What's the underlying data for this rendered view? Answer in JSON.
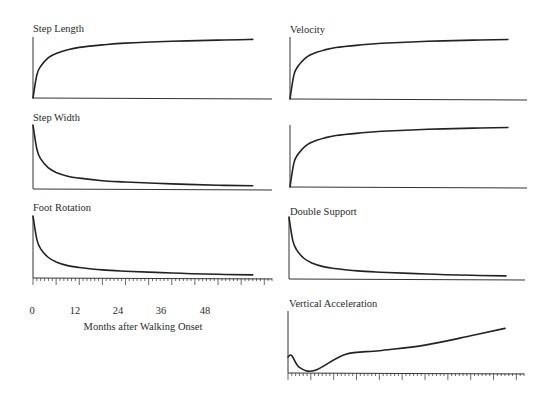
{
  "figure": {
    "x_axis_label": "Months after Walking Onset",
    "x_tick_labels": [
      "0",
      "12",
      "24",
      "36",
      "48"
    ]
  },
  "chart_data": [
    {
      "type": "line",
      "title": "Step Length",
      "xlabel": "Months after Walking Onset",
      "ylabel": "",
      "trend": "rapid rise then plateau",
      "x": [
        0,
        1,
        2,
        4,
        6,
        9,
        12,
        18,
        24,
        36,
        48,
        57
      ],
      "values": [
        0.0,
        0.38,
        0.52,
        0.66,
        0.73,
        0.79,
        0.83,
        0.87,
        0.9,
        0.93,
        0.95,
        0.96
      ],
      "xlim": [
        0,
        62
      ],
      "ylim": [
        0,
        1
      ]
    },
    {
      "type": "line",
      "title": "Step Width",
      "xlabel": "Months after Walking Onset",
      "ylabel": "",
      "trend": "rapid decline then plateau",
      "x": [
        0,
        1,
        2,
        4,
        6,
        9,
        12,
        18,
        24,
        36,
        48,
        57
      ],
      "values": [
        1.0,
        0.62,
        0.47,
        0.33,
        0.26,
        0.2,
        0.17,
        0.13,
        0.11,
        0.08,
        0.06,
        0.05
      ],
      "xlim": [
        0,
        62
      ],
      "ylim": [
        0,
        1
      ]
    },
    {
      "type": "line",
      "title": "Foot Rotation",
      "xlabel": "Months after Walking Onset",
      "ylabel": "",
      "trend": "rapid decline then plateau",
      "x": [
        0,
        1,
        2,
        4,
        6,
        9,
        12,
        18,
        24,
        36,
        48,
        57
      ],
      "values": [
        1.0,
        0.62,
        0.47,
        0.33,
        0.26,
        0.2,
        0.17,
        0.13,
        0.11,
        0.08,
        0.06,
        0.05
      ],
      "xlim": [
        0,
        62
      ],
      "ylim": [
        0,
        1
      ]
    },
    {
      "type": "line",
      "title": "Velocity",
      "xlabel": "",
      "ylabel": "",
      "trend": "rapid rise then plateau",
      "x": [
        0,
        1,
        2,
        4,
        6,
        9,
        12,
        18,
        24,
        36,
        48,
        57
      ],
      "values": [
        0.0,
        0.38,
        0.52,
        0.66,
        0.73,
        0.79,
        0.83,
        0.87,
        0.9,
        0.93,
        0.95,
        0.96
      ],
      "xlim": [
        0,
        62
      ],
      "ylim": [
        0,
        1
      ]
    },
    {
      "type": "line",
      "title": "",
      "xlabel": "",
      "ylabel": "",
      "trend": "rapid rise then plateau",
      "x": [
        0,
        1,
        2,
        4,
        6,
        9,
        12,
        18,
        24,
        36,
        48,
        57
      ],
      "values": [
        0.0,
        0.38,
        0.52,
        0.66,
        0.73,
        0.79,
        0.83,
        0.87,
        0.9,
        0.93,
        0.95,
        0.96
      ],
      "xlim": [
        0,
        62
      ],
      "ylim": [
        0,
        1
      ]
    },
    {
      "type": "line",
      "title": "Double Support",
      "xlabel": "",
      "ylabel": "",
      "trend": "rapid decline then plateau",
      "x": [
        0,
        1,
        2,
        4,
        6,
        9,
        12,
        18,
        24,
        36,
        48,
        57
      ],
      "values": [
        1.0,
        0.62,
        0.47,
        0.33,
        0.26,
        0.2,
        0.17,
        0.13,
        0.11,
        0.08,
        0.06,
        0.05
      ],
      "xlim": [
        0,
        62
      ],
      "ylim": [
        0,
        1
      ]
    },
    {
      "type": "line",
      "title": "Vertical Acceleration",
      "xlabel": "",
      "ylabel": "",
      "trend": "brief peak, dip, then steady rise",
      "x": [
        0,
        1,
        3,
        7,
        15,
        24,
        36,
        48,
        57
      ],
      "values": [
        0.26,
        0.28,
        0.09,
        0.04,
        0.3,
        0.36,
        0.45,
        0.6,
        0.72
      ],
      "xlim": [
        0,
        62
      ],
      "ylim": [
        0,
        1
      ]
    }
  ]
}
